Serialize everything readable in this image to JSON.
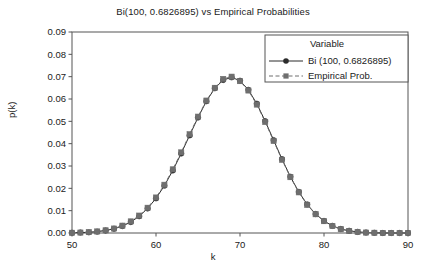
{
  "chart_data": {
    "type": "line",
    "title": "Bi(100, 0.6826895) vs Empirical Probabilities",
    "xlabel": "k",
    "ylabel": "p(k)",
    "xlim": [
      50,
      90
    ],
    "ylim": [
      0,
      0.09
    ],
    "xticks": [
      50,
      60,
      70,
      80,
      90
    ],
    "yticks": [
      0.0,
      0.01,
      0.02,
      0.03,
      0.04,
      0.05,
      0.06,
      0.07,
      0.08,
      0.09
    ],
    "ytick_labels": [
      "0.00",
      "0.01",
      "0.02",
      "0.03",
      "0.04",
      "0.05",
      "0.06",
      "0.07",
      "0.08",
      "0.09"
    ],
    "xtick_labels": [
      "50",
      "60",
      "70",
      "80",
      "90"
    ],
    "grid": false,
    "legend_position": "upper-right",
    "legend_title": "Variable",
    "x": [
      50,
      51,
      52,
      53,
      54,
      55,
      56,
      57,
      58,
      59,
      60,
      61,
      62,
      63,
      64,
      65,
      66,
      67,
      68,
      69,
      70,
      71,
      72,
      73,
      74,
      75,
      76,
      77,
      78,
      79,
      80,
      81,
      82,
      83,
      84,
      85,
      86,
      87,
      88,
      89,
      90
    ],
    "series": [
      {
        "name": "Bi (100, 0.6826895)",
        "marker": "circle",
        "linestyle": "solid",
        "color": "#2b2b2b",
        "values": [
          0.0001,
          0.0002,
          0.0003,
          0.0006,
          0.0011,
          0.0019,
          0.0031,
          0.0049,
          0.0075,
          0.011,
          0.0155,
          0.0212,
          0.028,
          0.0356,
          0.0437,
          0.0517,
          0.059,
          0.0648,
          0.0685,
          0.0697,
          0.0682,
          0.0641,
          0.0579,
          0.0501,
          0.0416,
          0.0331,
          0.0252,
          0.0184,
          0.0128,
          0.0085,
          0.0054,
          0.0032,
          0.0018,
          0.001,
          0.0005,
          0.0002,
          0.0001,
          0.0,
          0.0,
          0.0,
          0.0
        ]
      },
      {
        "name": "Empirical Prob.",
        "marker": "square",
        "linestyle": "dashed",
        "color": "#6e6e6e",
        "values": [
          0.0001,
          0.0002,
          0.0004,
          0.0007,
          0.0012,
          0.002,
          0.0033,
          0.0052,
          0.0078,
          0.0113,
          0.0159,
          0.0216,
          0.0285,
          0.0361,
          0.0442,
          0.0521,
          0.0593,
          0.065,
          0.069,
          0.07,
          0.068,
          0.0638,
          0.0575,
          0.0497,
          0.0412,
          0.0328,
          0.025,
          0.0182,
          0.0126,
          0.0084,
          0.0053,
          0.0031,
          0.0017,
          0.0009,
          0.0005,
          0.0002,
          0.0001,
          0.0,
          0.0,
          0.0,
          0.0
        ]
      }
    ],
    "peak": {
      "k": 69,
      "p": 0.0697
    }
  },
  "legend": {
    "title": "Variable",
    "entries": [
      {
        "label": "Bi (100, 0.6826895)",
        "marker": "circle",
        "linestyle": "solid"
      },
      {
        "label": "Empirical Prob.",
        "marker": "square",
        "linestyle": "dashed"
      }
    ]
  },
  "colors": {
    "series1": "#2b2b2b",
    "series2": "#6e6e6e",
    "axis": "#555555",
    "text": "#1a1a1a",
    "background": "#ffffff"
  }
}
